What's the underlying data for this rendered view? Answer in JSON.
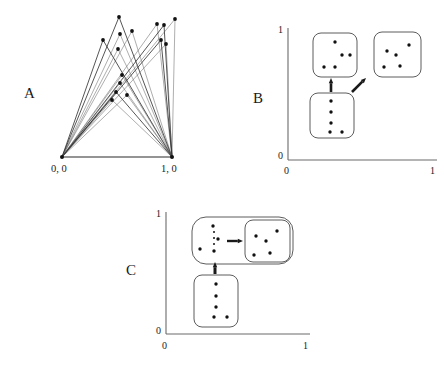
{
  "figure": {
    "title": "",
    "panels": [
      {
        "id": "A",
        "letter": "A",
        "type": "graph",
        "letter_pos": {
          "x": 24,
          "y": 85
        },
        "description": "bipartite-like graph with edges from two baseline vertices to many upper nodes",
        "base_nodes": [
          {
            "label": "0, 0",
            "x": 62,
            "y": 157,
            "label_x": 51,
            "label_y": 163
          },
          {
            "label": "1, 0",
            "x": 172,
            "y": 157,
            "label_x": 161,
            "label_y": 163
          }
        ],
        "upper_nodes": [
          {
            "x": 119,
            "y": 17
          },
          {
            "x": 120,
            "y": 34
          },
          {
            "x": 132,
            "y": 31
          },
          {
            "x": 103,
            "y": 40
          },
          {
            "x": 118,
            "y": 49
          },
          {
            "x": 157,
            "y": 24
          },
          {
            "x": 164,
            "y": 25
          },
          {
            "x": 175,
            "y": 19
          },
          {
            "x": 166,
            "y": 44
          },
          {
            "x": 161,
            "y": 40
          },
          {
            "x": 122,
            "y": 75
          },
          {
            "x": 120,
            "y": 83
          },
          {
            "x": 116,
            "y": 92
          },
          {
            "x": 127,
            "y": 95
          },
          {
            "x": 112,
            "y": 100
          }
        ],
        "baseline": {
          "x1": 62,
          "y1": 157,
          "x2": 172,
          "y2": 157
        }
      },
      {
        "id": "B",
        "letter": "B",
        "letter_pos": {
          "x": 253,
          "y": 90
        },
        "type": "unit-square",
        "axis": {
          "origin": {
            "x": 288,
            "y": 160
          },
          "x_end": {
            "x": 437,
            "y": 160
          },
          "y_end": {
            "x": 288,
            "y": 28
          }
        },
        "ticks": {
          "y_top": "1",
          "y_bottom": "0",
          "x_left": "0",
          "x_right": "1"
        },
        "tick_pos": {
          "y_top": {
            "x": 278,
            "y": 24
          },
          "y_bottom": {
            "x": 278,
            "y": 150
          },
          "x_left": {
            "x": 284,
            "y": 165
          },
          "x_right": {
            "x": 430,
            "y": 165
          }
        },
        "boxes": [
          {
            "name": "top-left-cluster",
            "x": 313,
            "y": 33,
            "w": 44,
            "h": 44,
            "r": 8,
            "dots": [
              [
                22,
                9
              ],
              [
                29,
                22
              ],
              [
                11,
                34
              ],
              [
                22,
                34
              ],
              [
                37,
                22
              ]
            ]
          },
          {
            "name": "top-right-cluster",
            "x": 374,
            "y": 32,
            "w": 47,
            "h": 45,
            "r": 8,
            "dots": [
              [
                13,
                19
              ],
              [
                22,
                23
              ],
              [
                35,
                13
              ],
              [
                10,
                35
              ],
              [
                26,
                34
              ]
            ]
          },
          {
            "name": "bottom-cluster",
            "x": 310,
            "y": 93,
            "w": 44,
            "h": 45,
            "r": 8,
            "dots": [
              [
                21,
                8
              ],
              [
                21,
                19
              ],
              [
                21,
                30
              ],
              [
                20,
                39
              ],
              [
                32,
                39
              ]
            ]
          }
        ],
        "arrows": [
          {
            "name": "up-arrow",
            "x1": 331,
            "y1": 92,
            "x2": 331,
            "y2": 78,
            "kind": "vertical"
          },
          {
            "name": "diagonal-arrow",
            "x1": 352,
            "y1": 92,
            "x2": 366,
            "y2": 78,
            "kind": "diagonal"
          }
        ]
      },
      {
        "id": "C",
        "letter": "C",
        "letter_pos": {
          "x": 126,
          "y": 262
        },
        "type": "unit-square",
        "axis": {
          "origin": {
            "x": 166,
            "y": 334
          },
          "x_end": {
            "x": 310,
            "y": 334
          },
          "y_end": {
            "x": 166,
            "y": 212
          }
        },
        "ticks": {
          "y_top": "1",
          "y_bottom": "0",
          "x_left": "0",
          "x_right": "1"
        },
        "tick_pos": {
          "y_top": {
            "x": 156,
            "y": 208
          },
          "y_bottom": {
            "x": 156,
            "y": 325
          },
          "x_left": {
            "x": 162,
            "y": 340
          },
          "x_right": {
            "x": 303,
            "y": 340
          }
        },
        "outer_box": {
          "name": "merged-cluster-box",
          "x": 192,
          "y": 217,
          "w": 101,
          "h": 47,
          "r": 14
        },
        "inner_box": {
          "name": "result-cluster-box",
          "x": 245,
          "y": 220,
          "w": 45,
          "h": 42,
          "r": 8,
          "dots": [
            [
              11,
              16
            ],
            [
              21,
              21
            ],
            [
              32,
              11
            ],
            [
              9,
              35
            ],
            [
              25,
              33
            ]
          ]
        },
        "outer_dots": [
          [
            21,
            9
          ],
          [
            26,
            22
          ],
          [
            8,
            32
          ],
          [
            22,
            34
          ]
        ],
        "ellipsis": {
          "x": 214,
          "y": 232,
          "count": 3,
          "gap": 6
        },
        "inner_arrow": {
          "name": "merge-arrow",
          "x1": 227,
          "y1": 241,
          "x2": 243,
          "y2": 241
        },
        "bottom_box": {
          "name": "bottom-cluster",
          "x": 194,
          "y": 275,
          "w": 44,
          "h": 52,
          "r": 8,
          "dots": [
            [
              22,
              9
            ],
            [
              22,
              21
            ],
            [
              22,
              32
            ],
            [
              20,
              42
            ],
            [
              33,
              42
            ]
          ]
        },
        "up_arrow": {
          "name": "up-arrow",
          "x1": 215,
          "y1": 274,
          "x2": 215,
          "y2": 262
        }
      }
    ],
    "colors": {
      "ink": "#1a1a1a",
      "edge": "#555555",
      "edge_dark": "#2b2b2b",
      "box_stroke": "#4a4a4a",
      "axis": "#6b6b6b",
      "dot": "#111111",
      "background": "#ffffff"
    }
  }
}
